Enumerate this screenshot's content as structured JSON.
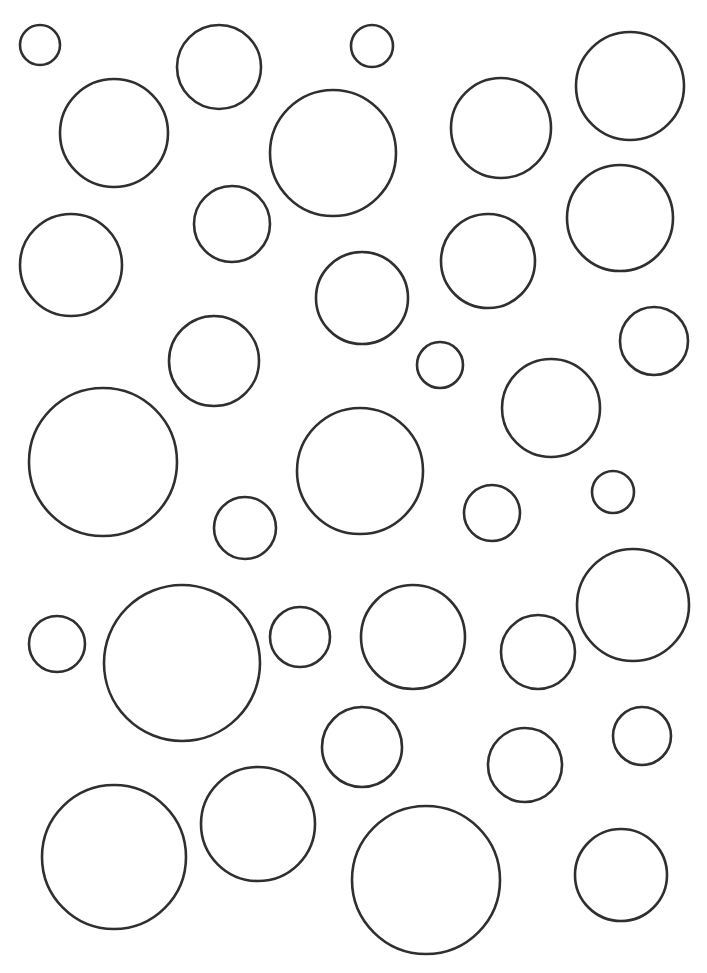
{
  "canvas": {
    "width": 707,
    "height": 973,
    "background": "#ffffff",
    "stroke_color": "#2f2f2f",
    "stroke_width": 2.6
  },
  "circles": [
    {
      "cx": 40,
      "cy": 45,
      "r": 20
    },
    {
      "cx": 219,
      "cy": 67,
      "r": 42
    },
    {
      "cx": 372,
      "cy": 46,
      "r": 21
    },
    {
      "cx": 630,
      "cy": 86,
      "r": 54
    },
    {
      "cx": 114,
      "cy": 133,
      "r": 54
    },
    {
      "cx": 333,
      "cy": 153,
      "r": 63
    },
    {
      "cx": 501,
      "cy": 128,
      "r": 50
    },
    {
      "cx": 232,
      "cy": 224,
      "r": 38
    },
    {
      "cx": 620,
      "cy": 218,
      "r": 53
    },
    {
      "cx": 71,
      "cy": 265,
      "r": 51
    },
    {
      "cx": 488,
      "cy": 261,
      "r": 47
    },
    {
      "cx": 362,
      "cy": 298,
      "r": 46
    },
    {
      "cx": 214,
      "cy": 361,
      "r": 45
    },
    {
      "cx": 440,
      "cy": 365,
      "r": 23
    },
    {
      "cx": 654,
      "cy": 341,
      "r": 34
    },
    {
      "cx": 551,
      "cy": 408,
      "r": 49
    },
    {
      "cx": 103,
      "cy": 462,
      "r": 74
    },
    {
      "cx": 360,
      "cy": 471,
      "r": 63
    },
    {
      "cx": 245,
      "cy": 528,
      "r": 31
    },
    {
      "cx": 492,
      "cy": 513,
      "r": 28
    },
    {
      "cx": 613,
      "cy": 492,
      "r": 21
    },
    {
      "cx": 57,
      "cy": 644,
      "r": 28
    },
    {
      "cx": 182,
      "cy": 663,
      "r": 78
    },
    {
      "cx": 300,
      "cy": 637,
      "r": 30
    },
    {
      "cx": 413,
      "cy": 637,
      "r": 52
    },
    {
      "cx": 538,
      "cy": 652,
      "r": 37
    },
    {
      "cx": 633,
      "cy": 605,
      "r": 56
    },
    {
      "cx": 362,
      "cy": 747,
      "r": 40
    },
    {
      "cx": 525,
      "cy": 765,
      "r": 37
    },
    {
      "cx": 642,
      "cy": 736,
      "r": 29
    },
    {
      "cx": 114,
      "cy": 857,
      "r": 72
    },
    {
      "cx": 258,
      "cy": 824,
      "r": 57
    },
    {
      "cx": 426,
      "cy": 880,
      "r": 74
    },
    {
      "cx": 621,
      "cy": 875,
      "r": 46
    }
  ]
}
